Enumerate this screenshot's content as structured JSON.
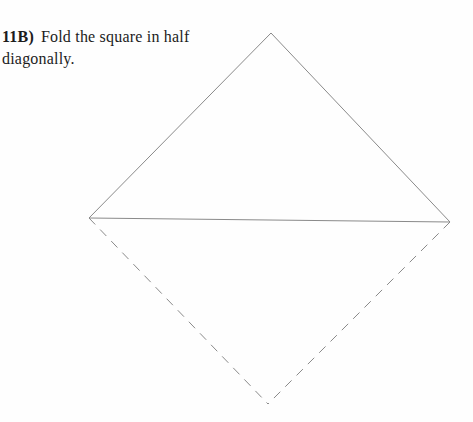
{
  "instruction": {
    "step": "11B)",
    "line1": "Fold the square in half",
    "line2": "diagonally."
  },
  "diagram": {
    "stroke_color": "#8a8a8a",
    "stroke_width": 1,
    "dash_pattern": "9,7",
    "vertices": {
      "top": [
        271,
        33
      ],
      "left": [
        89,
        218
      ],
      "right": [
        450,
        222
      ],
      "bottom": [
        268,
        404
      ]
    },
    "edges": [
      {
        "from": "top",
        "to": "left",
        "style": "solid",
        "name": "upper-left-edge"
      },
      {
        "from": "top",
        "to": "right",
        "style": "solid",
        "name": "upper-right-edge"
      },
      {
        "from": "left",
        "to": "right",
        "style": "solid",
        "name": "fold-line"
      },
      {
        "from": "left",
        "to": "bottom",
        "style": "dashed",
        "name": "lower-left-edge"
      },
      {
        "from": "right",
        "to": "bottom",
        "style": "dashed",
        "name": "lower-right-edge"
      }
    ]
  }
}
